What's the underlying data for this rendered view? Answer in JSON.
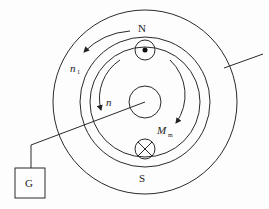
{
  "diagram": {
    "type": "physics-schematic",
    "labels": {
      "north_pole": "N",
      "south_pole": "S",
      "galvanometer": "G",
      "outer_rotation": "n",
      "outer_rotation_sub": "1",
      "inner_rotation": "n",
      "torque": "M",
      "torque_sub": "m"
    },
    "symbols": {
      "current_out": "dot-in-circle",
      "current_in": "cross-in-circle"
    }
  }
}
